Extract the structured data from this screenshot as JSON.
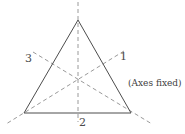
{
  "figure": {
    "width": 185,
    "height": 134,
    "background_color": "#ffffff"
  },
  "colors": {
    "shape_stroke": "#4d4d4d",
    "axis_stroke": "#9a9a9a",
    "label_text": "#4a4a4a",
    "note_text": "#3d3d3d"
  },
  "shape": {
    "name": "equilateral-triangle",
    "stroke_width": 1,
    "vertices": [
      {
        "id": "apex",
        "x": 78,
        "y": 20
      },
      {
        "id": "bottom-right",
        "x": 131,
        "y": 113
      },
      {
        "id": "bottom-left",
        "x": 24,
        "y": 113
      }
    ],
    "centroid": {
      "x": 78,
      "y": 82
    }
  },
  "axes": [
    {
      "id": "axis-1",
      "label": "1",
      "dash": "4 3",
      "stroke_width": 1,
      "x1": 124,
      "y1": 51,
      "x2": 6,
      "y2": 124,
      "label_position": {
        "x": 120,
        "y": 51
      }
    },
    {
      "id": "axis-2",
      "label": "2",
      "dash": "4 3",
      "stroke_width": 1,
      "x1": 78,
      "y1": 2,
      "x2": 78,
      "y2": 122,
      "label_position": {
        "x": 79,
        "y": 117
      }
    },
    {
      "id": "axis-3",
      "label": "3",
      "dash": "4 3",
      "stroke_width": 1,
      "x1": 33,
      "y1": 52,
      "x2": 152,
      "y2": 124,
      "label_position": {
        "x": 25,
        "y": 53
      }
    }
  ],
  "annotations": {
    "note": "(Axes fixed)"
  }
}
